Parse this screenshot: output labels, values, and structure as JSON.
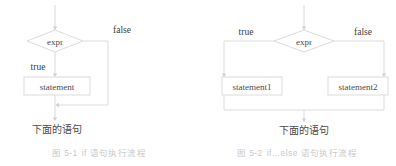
{
  "figures": [
    {
      "id": "if",
      "caption_label": "图 5-1",
      "caption_text": "if 语句执行流程",
      "caption_full": "图 5-1　if 语句执行流程",
      "decision": "expr",
      "branches": {
        "true": "true",
        "false": "false"
      },
      "process": "statement",
      "exit": "下面的语句"
    },
    {
      "id": "ifelse",
      "caption_label": "图 5-2",
      "caption_text": "if…else 语句执行流程",
      "caption_full": "图 5-2　if…else 语句执行流程",
      "decision": "expr",
      "branches": {
        "true": "true",
        "false": "false"
      },
      "process_true": "statement1",
      "process_false": "statement2",
      "exit": "下面的语句"
    }
  ],
  "colors": {
    "stroke": "#d9d9d9",
    "text": "#4a4a4a",
    "caption": "#c9c9c9",
    "background": "#ffffff"
  }
}
